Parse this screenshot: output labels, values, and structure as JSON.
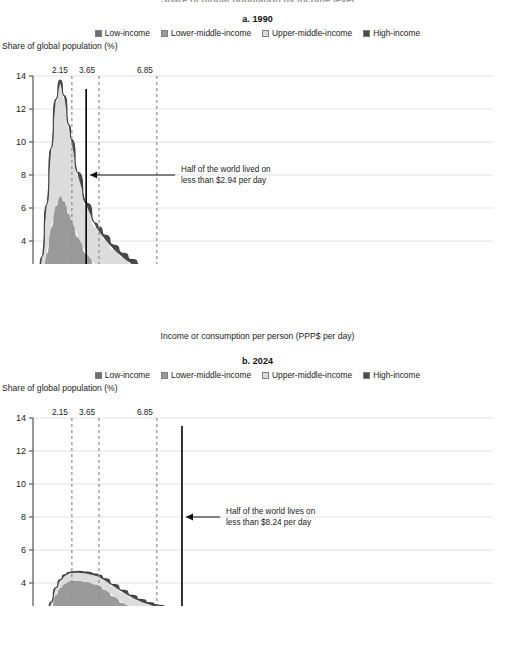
{
  "figure": {
    "clipped_header": "Share of global population by income level",
    "colors": {
      "low_income": "#6e6e6e",
      "lower_middle_income": "#9a9a9a",
      "upper_middle_income": "#dcdcdc",
      "high_income": "#4a4a4a",
      "outline": "#3a3a3a",
      "grid": "#e2e2e2",
      "axis": "#555555",
      "poverty_line": "#8c8c8c",
      "median_line": "#000000"
    },
    "legend": [
      {
        "label": "Low-income",
        "key": "low_income"
      },
      {
        "label": "Lower-middle-income",
        "key": "lower_middle_income"
      },
      {
        "label": "Upper-middle-income",
        "key": "upper_middle_income"
      },
      {
        "label": "High-income",
        "key": "high_income"
      }
    ],
    "y_axis_title": "Share of global population (%)",
    "x_axis_title": "Income or consumption per person (PPP$ per day)"
  },
  "chart_data": [
    {
      "type": "area",
      "panel_label": "a. 1990",
      "title": "a. 1990",
      "xlabel": "Income or consumption per person (PPP$ per day)",
      "ylabel": "Share of global population (%)",
      "xlim": [
        0,
        25
      ],
      "ylim": [
        0,
        14
      ],
      "xticks": [
        0,
        2,
        4,
        6,
        8,
        10,
        12,
        14,
        16,
        18,
        20,
        22,
        24
      ],
      "yticks": [
        0,
        2,
        4,
        6,
        8,
        10,
        12,
        14
      ],
      "grid": true,
      "legend_position": "top",
      "stacked": true,
      "x": [
        0,
        0.25,
        0.5,
        0.75,
        1,
        1.25,
        1.5,
        1.75,
        2,
        2.15,
        2.5,
        3,
        3.5,
        3.65,
        4,
        4.5,
        5,
        5.5,
        6,
        6.85,
        7,
        8,
        9,
        10,
        11,
        12,
        13,
        14,
        15,
        16,
        17,
        18,
        19,
        20,
        21,
        22,
        23,
        24,
        25
      ],
      "series": [
        {
          "name": "Low-income",
          "values": [
            0.0,
            0.12,
            0.35,
            0.62,
            0.85,
            1.02,
            1.12,
            1.05,
            0.92,
            0.86,
            0.72,
            0.58,
            0.47,
            0.45,
            0.4,
            0.34,
            0.29,
            0.25,
            0.22,
            0.18,
            0.17,
            0.13,
            0.1,
            0.08,
            0.06,
            0.05,
            0.04,
            0.04,
            0.03,
            0.03,
            0.02,
            0.02,
            0.02,
            0.02,
            0.01,
            0.01,
            0.01,
            0.01,
            0.01
          ]
        },
        {
          "name": "Lower-middle-income",
          "values": [
            0.0,
            0.4,
            1.35,
            2.6,
            3.95,
            5.1,
            5.6,
            5.35,
            4.7,
            4.35,
            3.5,
            2.6,
            2.0,
            1.88,
            1.62,
            1.32,
            1.1,
            0.92,
            0.78,
            0.62,
            0.6,
            0.44,
            0.34,
            0.26,
            0.21,
            0.17,
            0.14,
            0.12,
            0.1,
            0.09,
            0.08,
            0.07,
            0.06,
            0.05,
            0.05,
            0.04,
            0.04,
            0.03,
            0.03
          ]
        },
        {
          "name": "Upper-middle-income",
          "values": [
            0.0,
            0.35,
            1.3,
            2.9,
            4.7,
            6.3,
            6.85,
            6.2,
            5.2,
            4.7,
            3.7,
            2.85,
            2.35,
            2.25,
            2.05,
            1.8,
            1.58,
            1.4,
            1.24,
            1.02,
            0.99,
            0.79,
            0.64,
            0.53,
            0.44,
            0.37,
            0.31,
            0.27,
            0.23,
            0.2,
            0.18,
            0.16,
            0.14,
            0.12,
            0.11,
            0.1,
            0.09,
            0.08,
            0.07
          ]
        },
        {
          "name": "High-income",
          "values": [
            0.0,
            0.02,
            0.05,
            0.08,
            0.12,
            0.16,
            0.19,
            0.2,
            0.21,
            0.22,
            0.23,
            0.25,
            0.26,
            0.26,
            0.27,
            0.28,
            0.29,
            0.3,
            0.3,
            0.31,
            0.31,
            0.32,
            0.32,
            0.32,
            0.31,
            0.3,
            0.29,
            0.28,
            0.27,
            0.26,
            0.25,
            0.24,
            0.23,
            0.22,
            0.21,
            0.2,
            0.19,
            0.18,
            0.17
          ]
        }
      ],
      "poverty_lines": [
        {
          "label": "2.15",
          "value": 2.15
        },
        {
          "label": "3.65",
          "value": 3.65
        },
        {
          "label": "6.85",
          "value": 6.85
        }
      ],
      "median_line": {
        "value": 2.94
      },
      "annotation": {
        "line1": "Half of the world lived on",
        "line2": "less than $2.94 per day",
        "arrow_y": 8
      }
    },
    {
      "type": "area",
      "panel_label": "b. 2024",
      "title": "b. 2024",
      "xlabel": "Income or consumption per person (PPP$ per day)",
      "ylabel": "Share of global population (%)",
      "xlim": [
        0,
        25
      ],
      "ylim": [
        0,
        14
      ],
      "xticks": [
        0,
        2,
        4,
        6,
        8,
        10,
        12,
        14,
        16,
        18,
        20,
        22,
        24
      ],
      "yticks": [
        0,
        2,
        4,
        6,
        8,
        10,
        12,
        14
      ],
      "grid": true,
      "legend_position": "top",
      "stacked": true,
      "x": [
        0,
        0.25,
        0.5,
        0.75,
        1,
        1.25,
        1.5,
        1.75,
        2,
        2.15,
        2.5,
        3,
        3.5,
        3.65,
        4,
        4.5,
        5,
        5.5,
        6,
        6.5,
        6.85,
        7,
        7.5,
        8,
        8.24,
        9,
        10,
        11,
        12,
        13,
        14,
        15,
        16,
        17,
        18,
        19,
        20,
        21,
        22,
        23,
        24,
        25
      ],
      "series": [
        {
          "name": "Low-income",
          "values": [
            0.0,
            0.06,
            0.2,
            0.45,
            0.72,
            0.98,
            1.14,
            1.22,
            1.24,
            1.23,
            1.18,
            1.06,
            0.93,
            0.89,
            0.78,
            0.65,
            0.54,
            0.45,
            0.37,
            0.3,
            0.26,
            0.25,
            0.2,
            0.16,
            0.15,
            0.11,
            0.07,
            0.05,
            0.04,
            0.03,
            0.02,
            0.02,
            0.02,
            0.01,
            0.01,
            0.01,
            0.01,
            0.01,
            0.01,
            0.0,
            0.0,
            0.0
          ]
        },
        {
          "name": "Lower-middle-income",
          "values": [
            0.0,
            0.14,
            0.52,
            1.12,
            1.78,
            2.3,
            2.56,
            2.74,
            2.86,
            2.9,
            2.96,
            3.0,
            2.98,
            2.96,
            2.8,
            2.52,
            2.24,
            2.0,
            1.8,
            1.66,
            1.58,
            1.55,
            1.46,
            1.38,
            1.34,
            1.22,
            1.06,
            0.92,
            0.8,
            0.69,
            0.6,
            0.52,
            0.45,
            0.39,
            0.34,
            0.3,
            0.26,
            0.23,
            0.2,
            0.18,
            0.16,
            0.14
          ]
        },
        {
          "name": "Upper-middle-income",
          "values": [
            0.0,
            0.03,
            0.1,
            0.2,
            0.3,
            0.38,
            0.44,
            0.46,
            0.47,
            0.47,
            0.48,
            0.5,
            0.52,
            0.52,
            0.55,
            0.6,
            0.64,
            0.66,
            0.68,
            0.7,
            0.7,
            0.7,
            0.7,
            0.69,
            0.68,
            0.66,
            0.62,
            0.58,
            0.54,
            0.5,
            0.46,
            0.42,
            0.38,
            0.34,
            0.31,
            0.28,
            0.25,
            0.22,
            0.2,
            0.18,
            0.16,
            0.14
          ]
        },
        {
          "name": "High-income",
          "values": [
            0.0,
            0.01,
            0.02,
            0.03,
            0.04,
            0.05,
            0.06,
            0.07,
            0.08,
            0.08,
            0.09,
            0.1,
            0.11,
            0.11,
            0.12,
            0.13,
            0.13,
            0.14,
            0.14,
            0.14,
            0.15,
            0.15,
            0.15,
            0.15,
            0.15,
            0.15,
            0.15,
            0.15,
            0.14,
            0.14,
            0.13,
            0.13,
            0.12,
            0.12,
            0.11,
            0.11,
            0.1,
            0.1,
            0.09,
            0.09,
            0.08,
            0.08
          ]
        }
      ],
      "poverty_lines": [
        {
          "label": "2.15",
          "value": 2.15
        },
        {
          "label": "3.65",
          "value": 3.65
        },
        {
          "label": "6.85",
          "value": 6.85
        }
      ],
      "median_line": {
        "value": 8.24
      },
      "annotation": {
        "line1": "Half of the world lives on",
        "line2": "less than $8.24 per day",
        "arrow_y": 8
      }
    }
  ]
}
